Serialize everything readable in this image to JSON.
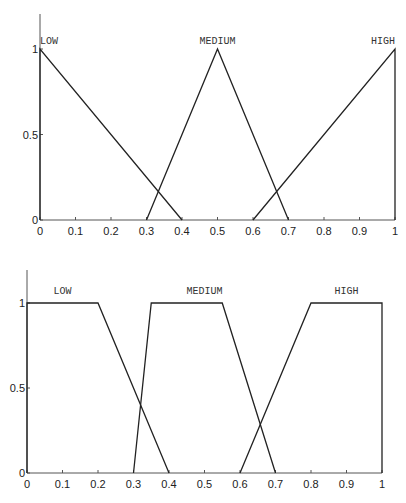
{
  "chart_data": [
    {
      "type": "line",
      "title": "Triangular membership functions",
      "xlabel": "",
      "ylabel": "",
      "xlim": [
        0,
        1
      ],
      "ylim": [
        0,
        1
      ],
      "x_ticks": [
        "0",
        "0.1",
        "0.2",
        "0.3",
        "0.4",
        "0.5",
        "0.6",
        "0.7",
        "0.8",
        "0.9",
        "1"
      ],
      "y_ticks": [
        "0",
        "0.5",
        "1"
      ],
      "grid": false,
      "series": [
        {
          "name": "LOW",
          "x": [
            0,
            0,
            0.4
          ],
          "y": [
            0,
            1,
            0
          ]
        },
        {
          "name": "MEDIUM",
          "x": [
            0.3,
            0.5,
            0.7
          ],
          "y": [
            0,
            1,
            0
          ]
        },
        {
          "name": "HIGH",
          "x": [
            0.6,
            1,
            1
          ],
          "y": [
            0,
            1,
            0
          ]
        }
      ]
    },
    {
      "type": "line",
      "title": "Trapezoidal membership functions",
      "xlabel": "",
      "ylabel": "",
      "xlim": [
        0,
        1
      ],
      "ylim": [
        0,
        1
      ],
      "x_ticks": [
        "0",
        "0.1",
        "0.2",
        "0.3",
        "0.4",
        "0.5",
        "0.6",
        "0.7",
        "0.8",
        "0.9",
        "1"
      ],
      "y_ticks": [
        "0",
        "0.5",
        "1"
      ],
      "grid": false,
      "series": [
        {
          "name": "LOW",
          "x": [
            0,
            0,
            0.2,
            0.4
          ],
          "y": [
            0,
            1,
            1,
            0
          ]
        },
        {
          "name": "MEDIUM",
          "x": [
            0.3,
            0.35,
            0.55,
            0.7
          ],
          "y": [
            0,
            1,
            1,
            0
          ]
        },
        {
          "name": "HIGH",
          "x": [
            0.6,
            0.8,
            1,
            1
          ],
          "y": [
            0,
            1,
            1,
            0
          ]
        }
      ]
    }
  ]
}
